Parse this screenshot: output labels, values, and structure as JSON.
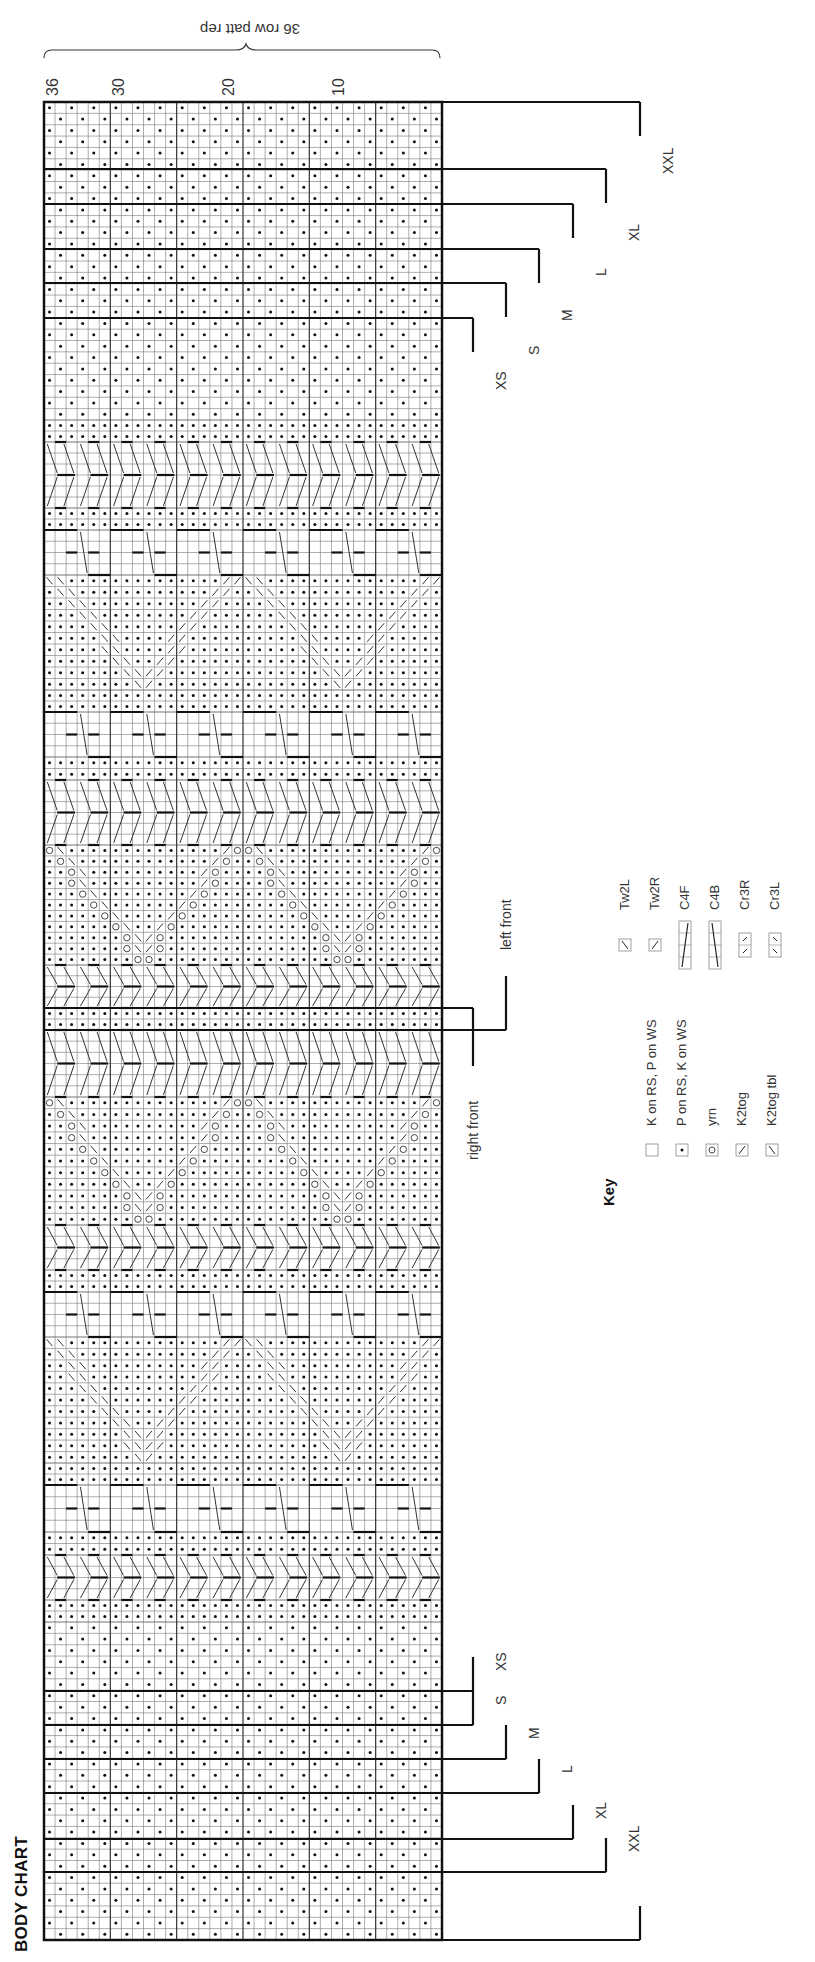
{
  "title": "BODY CHART",
  "repeat_label": "36 row patt rep",
  "row_ticks": [
    {
      "label": "36",
      "x": 54
    },
    {
      "label": "30",
      "x": 120
    },
    {
      "label": "20",
      "x": 230
    },
    {
      "label": "10",
      "x": 340
    }
  ],
  "front_labels": {
    "right": "right front",
    "left": "left front"
  },
  "sizes_top": [
    {
      "label": "XXL",
      "line_y": 102,
      "end_x": 640
    },
    {
      "label": "XL",
      "line_y": 169,
      "end_x": 606
    },
    {
      "label": "L",
      "line_y": 204,
      "end_x": 573
    },
    {
      "label": "M",
      "line_y": 249,
      "end_x": 539
    },
    {
      "label": "S",
      "line_y": 283,
      "end_x": 506
    },
    {
      "label": "XS",
      "line_y": 318,
      "end_x": 473
    }
  ],
  "sizes_bottom": [
    {
      "label": "XS",
      "line_y": 1691,
      "end_x": 473
    },
    {
      "label": "S",
      "line_y": 1725,
      "end_x": 473
    },
    {
      "label": "M",
      "line_y": 1759,
      "end_x": 506
    },
    {
      "label": "L",
      "line_y": 1793,
      "end_x": 539
    },
    {
      "label": "XL",
      "line_y": 1839,
      "end_x": 573
    },
    {
      "label": "XXL",
      "line_y": 1872,
      "end_x": 606
    },
    {
      "label": "",
      "line_y": 1940,
      "end_x": 640
    }
  ],
  "key": {
    "title": "Key",
    "items": [
      {
        "symbol": "blank",
        "label": "K on RS, P on WS"
      },
      {
        "symbol": "dot",
        "label": "P on RS, K on WS"
      },
      {
        "symbol": "circle",
        "label": "yrn"
      },
      {
        "symbol": "slash-right",
        "label": "K2tog"
      },
      {
        "symbol": "slash-left",
        "label": "K2tog tbl"
      },
      {
        "symbol": "tw2l",
        "label": "Tw2L"
      },
      {
        "symbol": "tw2r",
        "label": "Tw2R"
      },
      {
        "symbol": "c4f",
        "label": "C4F"
      },
      {
        "symbol": "c4b",
        "label": "C4B"
      },
      {
        "symbol": "cr3r",
        "label": "Cr3R"
      },
      {
        "symbol": "cr3l",
        "label": "Cr3L"
      }
    ]
  },
  "chart_data": {
    "type": "table",
    "title": "BODY CHART",
    "subtitle": "36 row patt rep",
    "orientation": "rotated 90deg clockwise",
    "columns": 36,
    "column_ticks": [
      36,
      30,
      20,
      10
    ],
    "grid_box": {
      "x0": 44,
      "y0": 102,
      "x1": 442,
      "y1": 1940
    },
    "bands": [
      {
        "from": 102,
        "to": 420,
        "type": "seed"
      },
      {
        "from": 420,
        "to": 442,
        "type": "purl"
      },
      {
        "from": 442,
        "to": 508,
        "type": "twist"
      },
      {
        "from": 508,
        "to": 530,
        "type": "purl"
      },
      {
        "from": 530,
        "to": 575,
        "type": "cable"
      },
      {
        "from": 575,
        "to": 690,
        "type": "diamond"
      },
      {
        "from": 690,
        "to": 712,
        "type": "purl"
      },
      {
        "from": 712,
        "to": 757,
        "type": "cable"
      },
      {
        "from": 757,
        "to": 780,
        "type": "purl"
      },
      {
        "from": 780,
        "to": 845,
        "type": "twist"
      },
      {
        "from": 845,
        "to": 965,
        "type": "lace"
      },
      {
        "from": 965,
        "to": 1008,
        "type": "twist"
      },
      {
        "from": 1008,
        "to": 1030,
        "type": "purl"
      },
      {
        "from": 1030,
        "to": 1097,
        "type": "twist"
      },
      {
        "from": 1097,
        "to": 1225,
        "type": "lace"
      },
      {
        "from": 1225,
        "to": 1270,
        "type": "twist"
      },
      {
        "from": 1270,
        "to": 1292,
        "type": "purl"
      },
      {
        "from": 1292,
        "to": 1337,
        "type": "cable"
      },
      {
        "from": 1337,
        "to": 1463,
        "type": "diamond"
      },
      {
        "from": 1463,
        "to": 1485,
        "type": "purl"
      },
      {
        "from": 1485,
        "to": 1532,
        "type": "cable"
      },
      {
        "from": 1532,
        "to": 1555,
        "type": "purl"
      },
      {
        "from": 1555,
        "to": 1600,
        "type": "twist"
      },
      {
        "from": 1600,
        "to": 1622,
        "type": "purl"
      },
      {
        "from": 1622,
        "to": 1940,
        "type": "seed"
      }
    ],
    "front_split_y": [
      1008,
      1030
    ],
    "legend": [
      "K on RS, P on WS",
      "P on RS, K on WS",
      "yrn",
      "K2tog",
      "K2tog tbl",
      "Tw2L",
      "Tw2R",
      "C4F",
      "C4B",
      "Cr3R",
      "Cr3L"
    ]
  }
}
